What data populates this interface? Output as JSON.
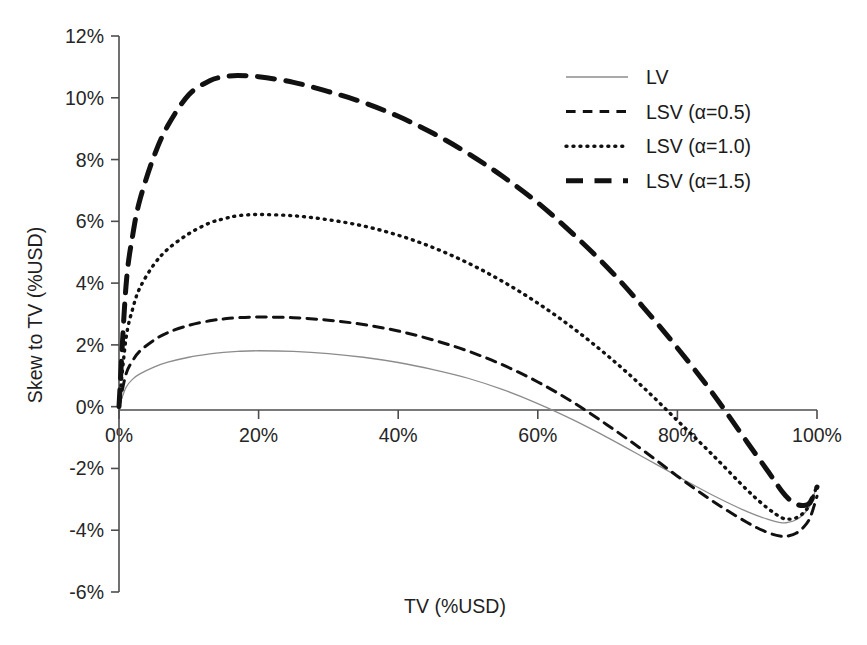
{
  "chart_data": {
    "type": "line",
    "title": "",
    "xlabel": "TV (%USD)",
    "ylabel": "Skew to TV (%USD)",
    "xlim": [
      0,
      100
    ],
    "ylim": [
      -6,
      12
    ],
    "x_ticks": [
      "0%",
      "20%",
      "40%",
      "60%",
      "80%",
      "100%"
    ],
    "x_tick_values": [
      0,
      20,
      40,
      60,
      80,
      100
    ],
    "y_ticks": [
      "12%",
      "10%",
      "8%",
      "6%",
      "4%",
      "2%",
      "0%",
      "-2%",
      "-4%",
      "-6%"
    ],
    "y_tick_values": [
      12,
      10,
      8,
      6,
      4,
      2,
      0,
      -2,
      -4,
      -6
    ],
    "grid": false,
    "legend_position": "top-right",
    "x": [
      0,
      1,
      2,
      3,
      5,
      7,
      10,
      13,
      15,
      17,
      20,
      25,
      30,
      35,
      40,
      45,
      50,
      55,
      60,
      65,
      70,
      75,
      80,
      85,
      90,
      93,
      95,
      96,
      97,
      98,
      99,
      100
    ],
    "series": [
      {
        "name": "LV",
        "style": "solid",
        "color": "#8c8c8c",
        "width": 1.3,
        "values": [
          0,
          0.62,
          0.9,
          1.06,
          1.28,
          1.44,
          1.6,
          1.71,
          1.76,
          1.79,
          1.81,
          1.79,
          1.72,
          1.6,
          1.43,
          1.2,
          0.92,
          0.55,
          0.1,
          -0.42,
          -1.0,
          -1.62,
          -2.25,
          -2.86,
          -3.4,
          -3.65,
          -3.76,
          -3.74,
          -3.66,
          -3.5,
          -3.2,
          -2.55
        ]
      },
      {
        "name": "LSV (α=0.5)",
        "style": "dashed",
        "color": "#111111",
        "width": 3.0,
        "values": [
          0,
          1.05,
          1.5,
          1.8,
          2.15,
          2.4,
          2.63,
          2.78,
          2.84,
          2.88,
          2.9,
          2.88,
          2.8,
          2.66,
          2.45,
          2.16,
          1.8,
          1.35,
          0.8,
          0.15,
          -0.6,
          -1.4,
          -2.25,
          -3.05,
          -3.75,
          -4.08,
          -4.2,
          -4.18,
          -4.1,
          -3.92,
          -3.6,
          -2.9
        ]
      },
      {
        "name": "LSV (α=1.0)",
        "style": "dotted",
        "color": "#111111",
        "width": 3.4,
        "values": [
          0,
          2.2,
          3.2,
          3.85,
          4.6,
          5.1,
          5.6,
          5.95,
          6.08,
          6.18,
          6.22,
          6.18,
          6.05,
          5.85,
          5.55,
          5.15,
          4.65,
          4.05,
          3.35,
          2.55,
          1.65,
          0.65,
          -0.45,
          -1.55,
          -2.7,
          -3.3,
          -3.6,
          -3.64,
          -3.6,
          -3.45,
          -3.15,
          -2.55
        ]
      },
      {
        "name": "LSV (α=1.5)",
        "style": "dashed-thick",
        "color": "#111111",
        "width": 5.0,
        "values": [
          0,
          3.9,
          5.6,
          6.7,
          8.1,
          9.1,
          10.1,
          10.55,
          10.68,
          10.72,
          10.68,
          10.5,
          10.2,
          9.85,
          9.4,
          8.85,
          8.2,
          7.45,
          6.6,
          5.6,
          4.5,
          3.25,
          1.9,
          0.45,
          -1.15,
          -2.1,
          -2.75,
          -3.0,
          -3.15,
          -3.2,
          -3.1,
          -2.6
        ]
      }
    ],
    "legend": [
      {
        "label": "LV",
        "style": "solid",
        "color": "#8c8c8c",
        "width": 1.3
      },
      {
        "label": "LSV (α=0.5)",
        "style": "dashed",
        "color": "#111111",
        "width": 3.0
      },
      {
        "label": "LSV (α=1.0)",
        "style": "dotted",
        "color": "#111111",
        "width": 3.4
      },
      {
        "label": "LSV (α=1.5)",
        "style": "dashed-thick",
        "color": "#111111",
        "width": 5.0
      }
    ]
  }
}
